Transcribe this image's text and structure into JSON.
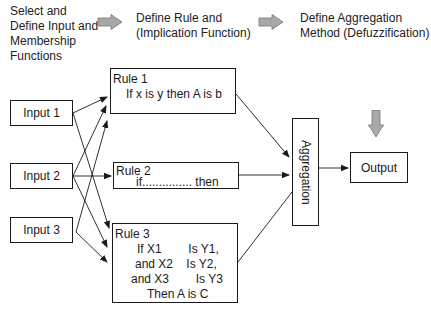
{
  "steps": [
    {
      "label": "Select and\nDefine Input and\nMembership\nFunctions"
    },
    {
      "label": "Define Rule and\n(Implication Function)"
    },
    {
      "label": "Define Aggregation\nMethod (Defuzzification)"
    }
  ],
  "step_arrows": [
    {
      "icon": "right-block-arrow-icon",
      "color": "#a8a8a8"
    },
    {
      "icon": "right-block-arrow-icon",
      "color": "#a8a8a8"
    }
  ],
  "inputs": [
    {
      "label": "Input 1"
    },
    {
      "label": "Input 2"
    },
    {
      "label": "Input 3"
    }
  ],
  "rules": [
    {
      "title": "Rule 1",
      "body": "If x is y then A is b"
    },
    {
      "title": "Rule 2",
      "body": "if............... then"
    },
    {
      "title": "Rule 3",
      "lines": [
        "If X1        Is Y1,",
        "and X2    Is Y2,",
        "and X3        Is Y3",
        "Then A is C"
      ]
    }
  ],
  "aggregation": {
    "label": "Aggregation"
  },
  "output": {
    "label": "Output"
  },
  "down_arrow": {
    "icon": "down-block-arrow-icon",
    "color": "#a8a8a8"
  }
}
